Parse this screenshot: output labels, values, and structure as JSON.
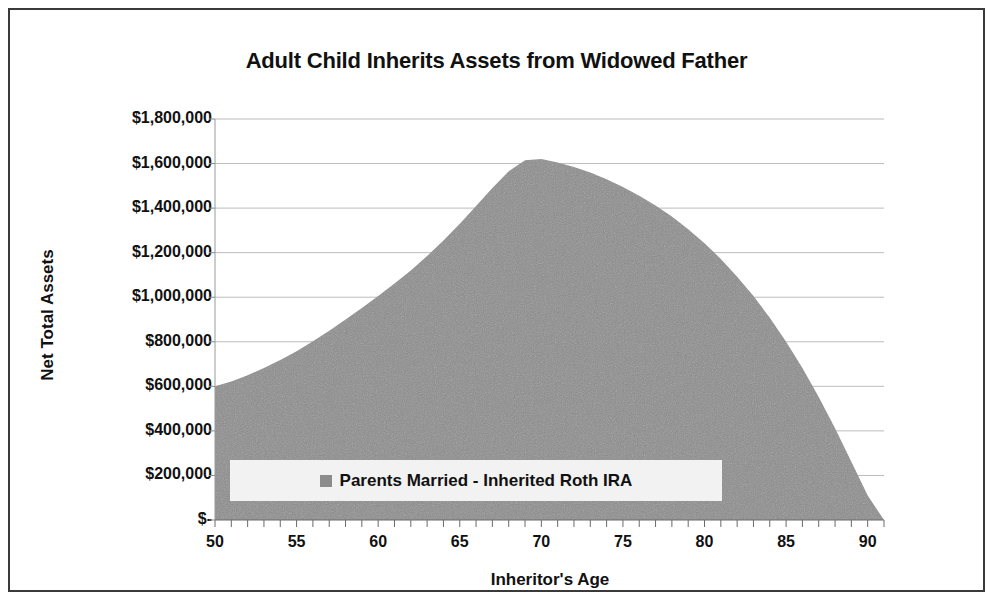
{
  "chart_data": {
    "type": "area",
    "title": "Adult Child Inherits Assets from Widowed Father",
    "xlabel": "Inheritor's Age",
    "ylabel": "Net Total Assets",
    "xlim": [
      50,
      91
    ],
    "ylim": [
      0,
      1800000
    ],
    "xticks": [
      50,
      55,
      60,
      65,
      70,
      75,
      80,
      85,
      90
    ],
    "xtick_labels": [
      "50",
      "55",
      "60",
      "65",
      "70",
      "75",
      "80",
      "85",
      "90"
    ],
    "x_minor_tick_step": 1,
    "yticks": [
      0,
      200000,
      400000,
      600000,
      800000,
      1000000,
      1200000,
      1400000,
      1600000,
      1800000
    ],
    "ytick_labels": [
      "$-",
      "$200,000",
      "$400,000",
      "$600,000",
      "$800,000",
      "$1,000,000",
      "$1,200,000",
      "$1,400,000",
      "$1,600,000",
      "$1,800,000"
    ],
    "grid": true,
    "grid_axis": "y",
    "legend_position": "inside-lower-left",
    "series": [
      {
        "name": "Parents Married - Inherited Roth IRA",
        "color": "#8c8c8c",
        "x": [
          50,
          51,
          52,
          53,
          54,
          55,
          56,
          57,
          58,
          59,
          60,
          61,
          62,
          63,
          64,
          65,
          66,
          67,
          68,
          69,
          70,
          71,
          72,
          73,
          74,
          75,
          76,
          77,
          78,
          79,
          80,
          81,
          82,
          83,
          84,
          85,
          86,
          87,
          88,
          89,
          90,
          91
        ],
        "values": [
          600000,
          622000,
          650000,
          682000,
          718000,
          758000,
          802000,
          850000,
          900000,
          952000,
          1005000,
          1062000,
          1120000,
          1185000,
          1255000,
          1330000,
          1410000,
          1490000,
          1565000,
          1615000,
          1620000,
          1605000,
          1585000,
          1560000,
          1530000,
          1495000,
          1455000,
          1412000,
          1362000,
          1305000,
          1242000,
          1172000,
          1092000,
          1005000,
          908000,
          800000,
          682000,
          552000,
          412000,
          262000,
          110000,
          0
        ]
      }
    ]
  },
  "legend": {
    "swatch_color": "#8c8c8c",
    "label": "Parents Married - Inherited Roth IRA"
  }
}
